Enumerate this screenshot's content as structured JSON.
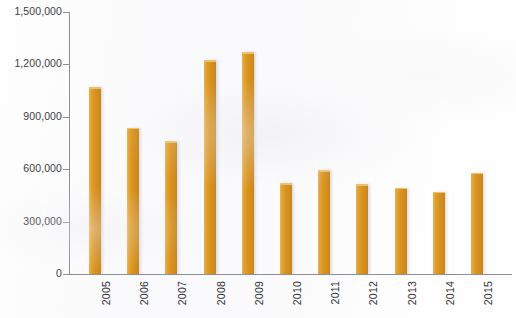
{
  "chart_data": {
    "type": "bar",
    "title": "",
    "subtitle": "",
    "xlabel": "",
    "ylabel": "",
    "categories": [
      "2005",
      "2006",
      "2007",
      "2008",
      "2009",
      "2010",
      "2011",
      "2012",
      "2013",
      "2014",
      "2015"
    ],
    "values": [
      1070000,
      836000,
      760000,
      1225000,
      1270000,
      520000,
      595000,
      515000,
      495000,
      470000,
      580000
    ],
    "series": [
      {
        "name": "",
        "values": [
          1070000,
          836000,
          760000,
          1225000,
          1270000,
          520000,
          595000,
          515000,
          495000,
          470000,
          580000
        ]
      }
    ],
    "ylim": [
      0,
      1500000
    ],
    "ytick_values": [
      0,
      300000,
      600000,
      900000,
      1200000,
      1500000
    ],
    "ytick_labels": [
      "0",
      "300,000",
      "600,000",
      "900,000",
      "1,200,000",
      "1,500,000"
    ],
    "grid": false,
    "legend": false,
    "legend_position": "none",
    "bar_color": "#d9931f",
    "axis_color": "#8e8e96",
    "background_color": "#fefefe",
    "xlabel_rotation": 90
  },
  "title_strip": {
    "cropped_text": ""
  }
}
